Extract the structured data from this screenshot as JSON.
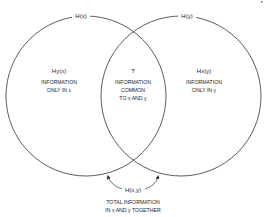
{
  "diagram": {
    "type": "venn",
    "colors": {
      "stroke": "#333333",
      "background": "#ffffff",
      "text": "#222222"
    },
    "circles": [
      {
        "id": "x",
        "label": "H(x)",
        "cx": 86,
        "cy": 96,
        "r": 80
      },
      {
        "id": "y",
        "label": "H(y)",
        "cx": 181,
        "cy": 96,
        "r": 80
      }
    ],
    "regions": {
      "left": {
        "symbol": "Hy(x)",
        "line1": "INFORMATION",
        "line2": "ONLY IN x"
      },
      "center": {
        "symbol": "T",
        "line1": "INFORMATION",
        "line2": "COMMON",
        "line3": "TO x AND y"
      },
      "right": {
        "symbol": "Hx(y)",
        "line1": "INFORMATION",
        "line2": "ONLY IN y"
      }
    },
    "joint": {
      "label": "H(x,y)",
      "caption_line1": "TOTAL INFORMATION",
      "caption_line2": "IN x AND y TOGETHER"
    }
  }
}
